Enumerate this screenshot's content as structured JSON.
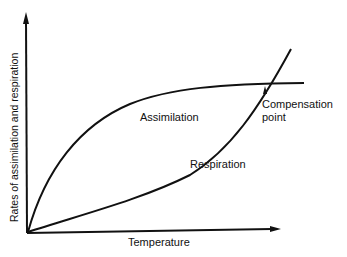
{
  "diagram": {
    "type": "line",
    "title": "",
    "axes": {
      "x_label": "Temperature",
      "y_label": "Rates of assimilation and respiration"
    },
    "curves": [
      {
        "name": "Assimilation",
        "label": "Assimilation",
        "shape": "concave rising, saturating plateau"
      },
      {
        "name": "Respiration",
        "label": "Respiration",
        "shape": "convex rising, accelerating"
      }
    ],
    "annotation": {
      "line1": "Compensation",
      "line2": "point"
    },
    "colors": {
      "line": "#111111",
      "background": "#ffffff"
    }
  }
}
